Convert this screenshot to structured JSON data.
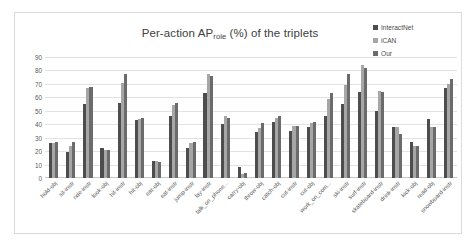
{
  "chart": {
    "title_main": "Per-action AP",
    "title_sub": "role",
    "title_tail": " (%) of the triplets"
  },
  "legend": {
    "position": "top-right",
    "items": [
      {
        "label": "InteractNet",
        "color": "#4d4d4d"
      },
      {
        "label": "iCAN",
        "color": "#a6a6a6"
      },
      {
        "label": "Our",
        "color": "#6b6b6b"
      }
    ]
  },
  "chart_data": {
    "type": "bar",
    "xlabel": "",
    "ylabel": "",
    "ylim": [
      0,
      90
    ],
    "yticks": [
      0,
      10,
      20,
      30,
      40,
      50,
      60,
      70,
      80,
      90
    ],
    "ytick_labels": [
      "0",
      "10",
      "20",
      "30",
      "40",
      "50",
      "60",
      "70",
      "80",
      "90"
    ],
    "grid": true,
    "legend_position": "top-right",
    "categories": [
      "hold-obj",
      "sit-instr",
      "ride-instr",
      "look-obj",
      "hit-instr",
      "hit-obj",
      "eat-obj",
      "eat-instr",
      "jump-instr",
      "lay-instr",
      "talk_on_phone...",
      "carry-obj",
      "throw-obj",
      "catch-obj",
      "cut-instr",
      "cut-obj",
      "work_on_com...",
      "ski-instr",
      "surf-instr",
      "skateboard-instr",
      "drink-instr",
      "kick-obj",
      "read-obj",
      "snowboard-instr"
    ],
    "series": [
      {
        "name": "InteractNet",
        "color": "#4d4d4d",
        "values": [
          26,
          19,
          55,
          22,
          56,
          43,
          13,
          46,
          22,
          63,
          40,
          8,
          34,
          42,
          35,
          38,
          46,
          55,
          64,
          50,
          38,
          27,
          44,
          67
        ]
      },
      {
        "name": "iCAN",
        "color": "#a6a6a6",
        "values": [
          26,
          24,
          67,
          21,
          71,
          44,
          13,
          54,
          26,
          77,
          46,
          3,
          37,
          45,
          39,
          41,
          59,
          69,
          84,
          65,
          38,
          24,
          38,
          70
        ]
      },
      {
        "name": "Our",
        "color": "#6b6b6b",
        "values": [
          27,
          27,
          68,
          21,
          77,
          45,
          12,
          56,
          27,
          76,
          45,
          4,
          41,
          46,
          39,
          42,
          63,
          77,
          82,
          64,
          33,
          24,
          38,
          74
        ]
      }
    ]
  }
}
